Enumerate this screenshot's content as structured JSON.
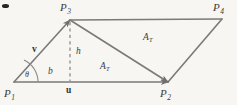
{
  "figure": {
    "background_color": "#f7f6f2",
    "stroke_color": "#7a7a7a",
    "text_color": "#3a3a3a",
    "vertices": [
      {
        "id": "P1",
        "label": "P",
        "subscript": "1",
        "x": 14,
        "y": 82
      },
      {
        "id": "P2",
        "label": "P",
        "subscript": "2",
        "x": 168,
        "y": 82
      },
      {
        "id": "P3",
        "label": "P",
        "subscript": "3",
        "x": 70,
        "y": 20
      },
      {
        "id": "P4",
        "label": "P",
        "subscript": "4",
        "x": 222,
        "y": 19
      }
    ],
    "labels": {
      "p1": "P",
      "p1_sub": "1",
      "p2": "P",
      "p2_sub": "2",
      "p3": "P",
      "p3_sub": "3",
      "p4": "P",
      "p4_sub": "4",
      "vector_v": "v",
      "vector_u": "u",
      "base": "b",
      "height": "h",
      "angle": "θ",
      "area_upper": "A",
      "area_upper_sub": "T",
      "area_lower": "A",
      "area_lower_sub": "T"
    }
  }
}
